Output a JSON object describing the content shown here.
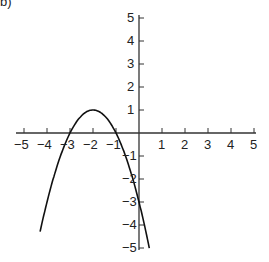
{
  "label": "b)",
  "chart_data": {
    "type": "line",
    "title": "",
    "xlabel": "",
    "ylabel": "",
    "xlim": [
      -5,
      5
    ],
    "ylim": [
      -5,
      5
    ],
    "grid": false,
    "x_ticks": [
      -5,
      -4,
      -3,
      -2,
      -1,
      1,
      2,
      3,
      4,
      5
    ],
    "y_ticks": [
      5,
      4,
      3,
      2,
      1,
      -1,
      -2,
      -3,
      -4,
      -5
    ],
    "series": [
      {
        "name": "y = -(x+2)^2 + 1",
        "x": [
          -4.3,
          -4,
          -3.5,
          -3,
          -2.5,
          -2,
          -1.5,
          -1,
          -0.5,
          0,
          0.45
        ],
        "y": [
          -4.29,
          -3,
          -1.25,
          0,
          0.75,
          1,
          0.75,
          0,
          -1.25,
          -3,
          -5
        ]
      }
    ],
    "annotations": []
  }
}
